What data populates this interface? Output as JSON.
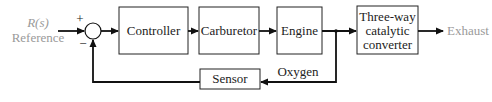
{
  "diagram": {
    "type": "feedback-control-block-diagram",
    "input": {
      "symbol": "R(s)",
      "label": "Reference",
      "color": "#9a9a9a"
    },
    "summing_junction": {
      "plus_sign": "+",
      "minus_sign": "−"
    },
    "blocks": [
      {
        "id": "controller",
        "label": "Controller"
      },
      {
        "id": "carburetor",
        "label": "Carburetor"
      },
      {
        "id": "engine",
        "label": "Engine"
      },
      {
        "id": "converter",
        "label_lines": [
          "Three-way",
          "catalytic",
          "converter"
        ]
      },
      {
        "id": "sensor",
        "label": "Sensor"
      }
    ],
    "signals": {
      "feedback_label": "Oxygen",
      "output_label": "Exhaust",
      "output_color": "#9a9a9a"
    },
    "edges": [
      [
        "input",
        "summing_junction"
      ],
      [
        "summing_junction",
        "controller"
      ],
      [
        "controller",
        "carburetor"
      ],
      [
        "carburetor",
        "engine"
      ],
      [
        "engine",
        "converter"
      ],
      [
        "converter",
        "output"
      ],
      [
        "engine",
        "sensor"
      ],
      [
        "sensor",
        "summing_junction"
      ]
    ]
  }
}
